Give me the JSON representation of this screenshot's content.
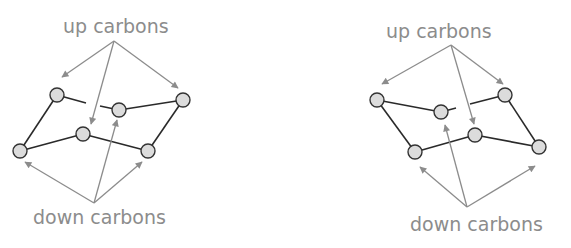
{
  "colors": {
    "label": "#8c8c8c",
    "arrow": "#8c8c8c",
    "bond": "#2a2a2a",
    "atom_fill": "#dcdcdc",
    "atom_stroke": "#333333"
  },
  "diagrams": [
    {
      "name": "chair-left",
      "up_label": "up carbons",
      "down_label": "down carbons"
    },
    {
      "name": "chair-right",
      "up_label": "up carbons",
      "down_label": "down carbons"
    }
  ]
}
